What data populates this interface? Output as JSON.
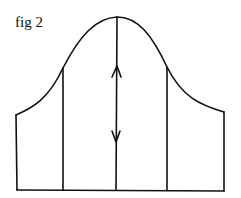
{
  "figure": {
    "label": "fig 2",
    "line_color": "#111111",
    "background": "#ffffff"
  },
  "diagram": {
    "type": "bell-curve-with-vertical-divisions",
    "elements": [
      {
        "name": "bell-curve",
        "description": "Bell-shaped curve peaking at center"
      },
      {
        "name": "left-edge",
        "description": "Left vertical boundary line"
      },
      {
        "name": "left-division",
        "description": "Vertical line left of center"
      },
      {
        "name": "center-line",
        "description": "Central vertical line from peak to baseline with double-headed arrow"
      },
      {
        "name": "right-division",
        "description": "Vertical line right of center"
      },
      {
        "name": "right-edge",
        "description": "Right vertical boundary line"
      },
      {
        "name": "baseline",
        "description": "Horizontal baseline"
      }
    ],
    "arrows": [
      {
        "name": "up-arrowhead",
        "direction": "up"
      },
      {
        "name": "down-arrowhead",
        "direction": "down"
      }
    ]
  }
}
